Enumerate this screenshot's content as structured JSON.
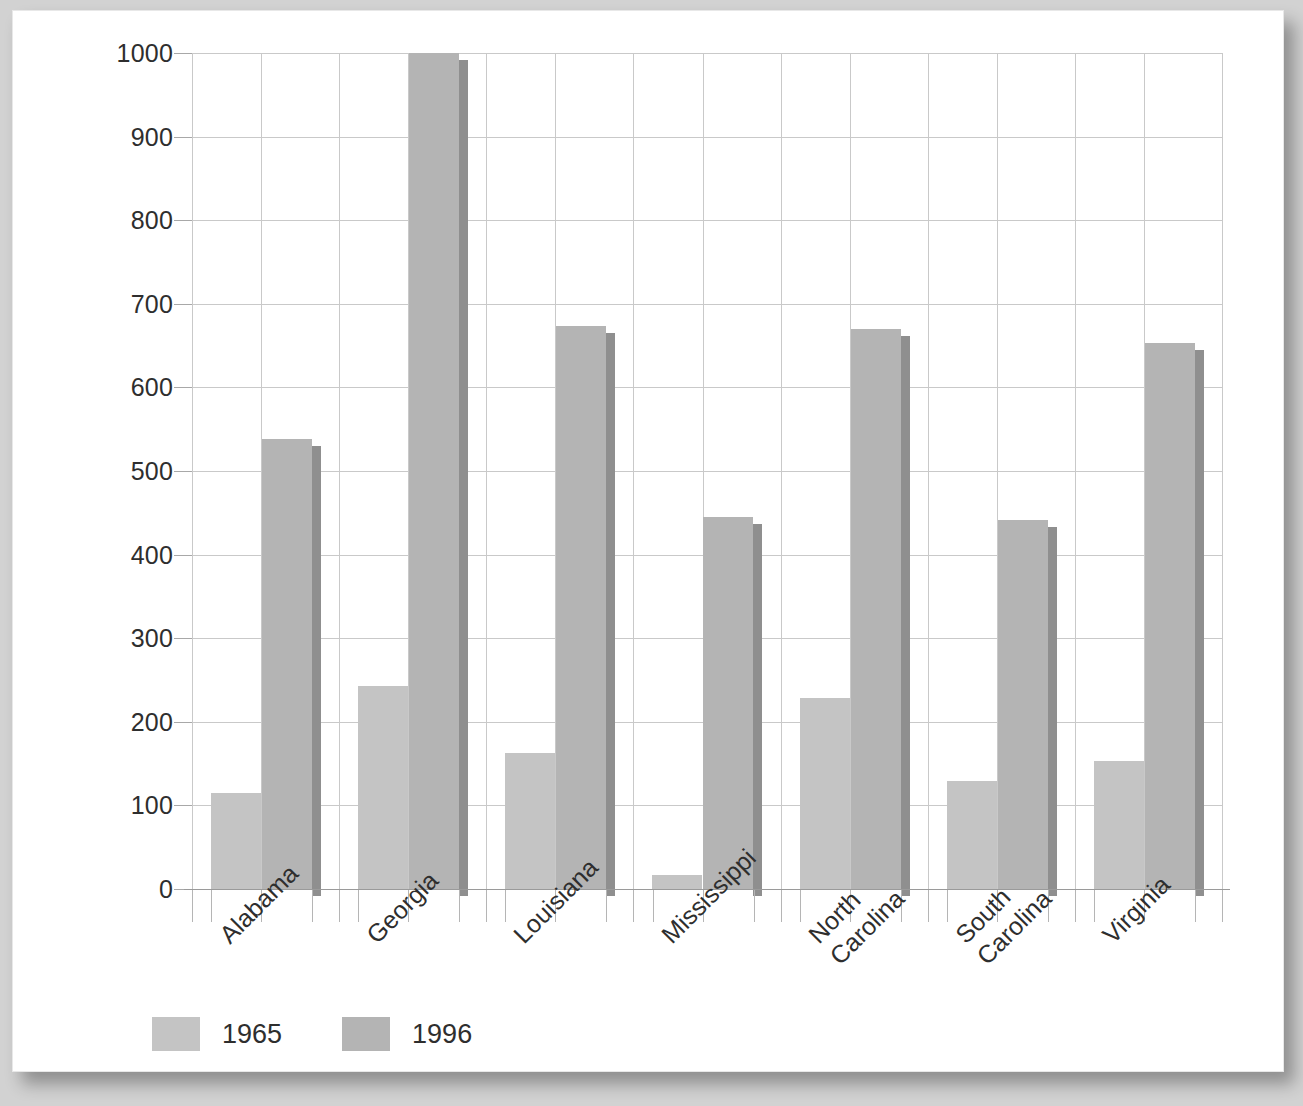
{
  "chart_data": {
    "type": "bar",
    "title": "",
    "xlabel": "",
    "ylabel": "Number of voters (in thousands)",
    "ylim": [
      0,
      1000
    ],
    "yticks": [
      0,
      100,
      200,
      300,
      400,
      500,
      600,
      700,
      800,
      900,
      1000
    ],
    "ytick_labels": [
      "0",
      "100",
      "200",
      "300",
      "400",
      "500",
      "600",
      "700",
      "800",
      "900",
      "1000"
    ],
    "grid": true,
    "legend_position": "bottom-left",
    "categories": [
      "Alabama",
      "Georgia",
      "Louisiana",
      "Mississippi",
      "North Carolina",
      "South Carolina",
      "Virginia"
    ],
    "category_lines": [
      [
        "Alabama"
      ],
      [
        "Georgia"
      ],
      [
        "Louisiana"
      ],
      [
        "Mississippi"
      ],
      [
        "North",
        "Carolina"
      ],
      [
        "South",
        "Carolina"
      ],
      [
        "Virginia"
      ]
    ],
    "series": [
      {
        "name": "1965",
        "color": "#c4c4c4",
        "values": [
          115,
          243,
          163,
          17,
          229,
          129,
          153
        ]
      },
      {
        "name": "1996",
        "color": "#b4b4b4",
        "values": [
          538,
          1000,
          673,
          445,
          670,
          442,
          653
        ]
      }
    ]
  },
  "legend": {
    "items": [
      {
        "label": "1965"
      },
      {
        "label": "1996"
      }
    ]
  },
  "colors": {
    "series_1965": "#c4c4c4",
    "series_1996": "#b4b4b4",
    "bar_shadow": "#8f8f8f",
    "gridline": "#c9c9c9",
    "text": "#2e2e2e",
    "panel_background": "#ffffff",
    "page_background": "#d2d2d2"
  }
}
